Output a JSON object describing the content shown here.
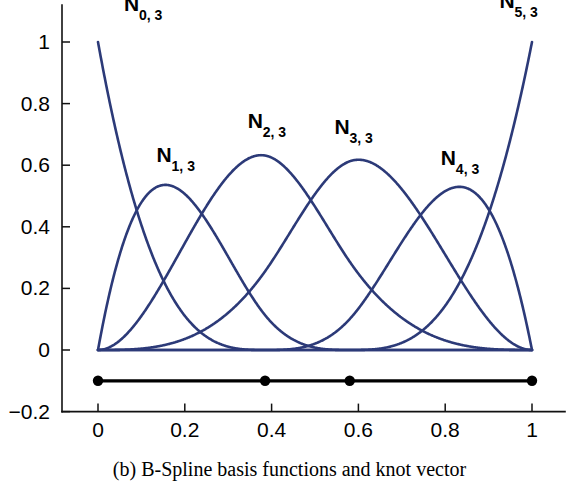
{
  "caption": "(b)  B-Spline basis functions and knot vector",
  "chart_data": {
    "type": "line",
    "title": "",
    "subtitle": "",
    "xlabel": "",
    "ylabel": "",
    "xlim": [
      -0.06,
      1.06
    ],
    "ylim": [
      -0.2,
      1.12
    ],
    "grid": false,
    "legend": "inline-curve-labels",
    "x_ticks": [
      0,
      0.2,
      0.4,
      0.6,
      0.8,
      1
    ],
    "x_tick_labels": [
      "0",
      "0.2",
      "0.4",
      "0.6",
      "0.8",
      "1"
    ],
    "y_ticks": [
      -0.2,
      0,
      0.2,
      0.4,
      0.6,
      0.8,
      1
    ],
    "y_tick_labels": [
      "-0.2",
      "0",
      "0.2",
      "0.4",
      "0.6",
      "0.8",
      "1"
    ],
    "curve_color": "#2c3a78",
    "degree": 3,
    "knot_vector": [
      0,
      0,
      0,
      0,
      0.385,
      0.58,
      1,
      1,
      1,
      1
    ],
    "knot_markers": {
      "label": "knot vector",
      "y_value": -0.1,
      "color": "#000000",
      "positions": [
        0,
        0.385,
        0.58,
        1
      ]
    },
    "series": [
      {
        "name": "N_0,3",
        "label_main": "N",
        "label_sub": "0, 3",
        "label_x": 0.06,
        "label_y": 1.1,
        "peak_x": 0,
        "peak_y": 1.0
      },
      {
        "name": "N_1,3",
        "label_main": "N",
        "label_sub": "1, 3",
        "label_x": 0.135,
        "label_y": 0.61,
        "peak_x": 0.15,
        "peak_y": 0.52
      },
      {
        "name": "N_2,3",
        "label_main": "N",
        "label_sub": "2, 3",
        "label_x": 0.345,
        "label_y": 0.72,
        "peak_x": 0.385,
        "peak_y": 0.63
      },
      {
        "name": "N_3,3",
        "label_main": "N",
        "label_sub": "3, 3",
        "label_x": 0.545,
        "label_y": 0.7,
        "peak_x": 0.585,
        "peak_y": 0.61
      },
      {
        "name": "N_4,3",
        "label_main": "N",
        "label_sub": "4, 3",
        "label_x": 0.79,
        "label_y": 0.6,
        "peak_x": 0.835,
        "peak_y": 0.51
      },
      {
        "name": "N_5,3",
        "label_main": "N",
        "label_sub": "5, 3",
        "label_x": 0.925,
        "label_y": 1.11,
        "peak_x": 1.0,
        "peak_y": 1.0
      }
    ]
  }
}
